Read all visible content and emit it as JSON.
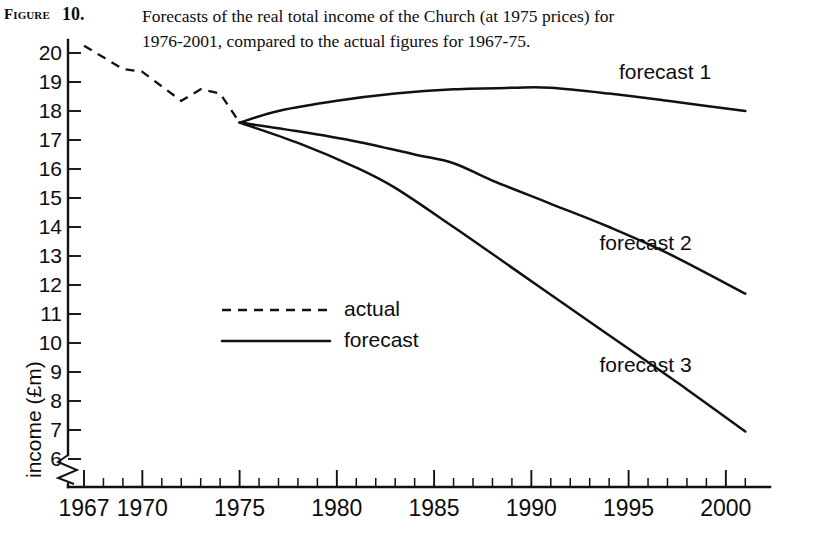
{
  "caption": {
    "tag": "Figure",
    "number": "10.",
    "line1": "Forecasts of the real total income of the Church (at 1975 prices) for",
    "line2": "1976-2001, compared to the actual figures for 1967-75."
  },
  "chart_data": {
    "type": "line",
    "title": "Forecasts of the real total income of the Church (at 1975 prices) for 1976-2001, compared to the actual figures for 1967-75.",
    "xlabel": "",
    "ylabel": "income (£m)",
    "xlim": [
      1967,
      2001
    ],
    "ylim": [
      6,
      20.4
    ],
    "y_axis_break": true,
    "y_axis_break_note": "axis broken below 6",
    "grid": false,
    "legend_position": "inside-left-middle",
    "yticks": [
      20,
      19,
      18,
      17,
      16,
      15,
      14,
      13,
      12,
      11,
      10,
      9,
      8,
      7,
      6
    ],
    "xticks": [
      1967,
      1970,
      1975,
      1980,
      1985,
      1990,
      1995,
      2000
    ],
    "xminor_step": 1,
    "legend": [
      {
        "key": "actual",
        "label": "actual",
        "style": "dashed"
      },
      {
        "key": "forecast",
        "label": "forecast",
        "style": "solid"
      }
    ],
    "series": [
      {
        "name": "actual",
        "style": "dashed",
        "x": [
          1967,
          1968,
          1969,
          1970,
          1971,
          1972,
          1973,
          1974,
          1975
        ],
        "values": [
          20.25,
          19.85,
          19.45,
          19.35,
          18.85,
          18.35,
          18.75,
          18.6,
          17.6
        ]
      },
      {
        "name": "forecast 1",
        "style": "solid",
        "label": "forecast 1",
        "x": [
          1975,
          1977,
          1980,
          1983,
          1986,
          1989,
          1991,
          1994,
          1997,
          2001
        ],
        "values": [
          17.6,
          18.0,
          18.35,
          18.6,
          18.75,
          18.8,
          18.8,
          18.6,
          18.35,
          18.0
        ]
      },
      {
        "name": "forecast 2",
        "style": "solid",
        "label": "forecast 2",
        "x": [
          1975,
          1978,
          1981,
          1984,
          1986,
          1988,
          1991,
          1994,
          1997,
          2001
        ],
        "values": [
          17.6,
          17.3,
          16.95,
          16.5,
          16.2,
          15.6,
          14.8,
          14.0,
          13.1,
          11.7
        ]
      },
      {
        "name": "forecast 3",
        "style": "solid",
        "label": "forecast 3",
        "x": [
          1975,
          1978,
          1981,
          1983,
          1986,
          1989,
          1992,
          1995,
          1998,
          2001
        ],
        "values": [
          17.6,
          16.9,
          16.05,
          15.35,
          14.0,
          12.6,
          11.2,
          9.8,
          8.4,
          6.95
        ]
      }
    ],
    "annotations": [
      {
        "text": "forecast 1",
        "x": 1994.5,
        "y": 19.3
      },
      {
        "text": "forecast 2",
        "x": 1993.5,
        "y": 13.4
      },
      {
        "text": "forecast 3",
        "x": 1993.5,
        "y": 9.2
      }
    ]
  }
}
